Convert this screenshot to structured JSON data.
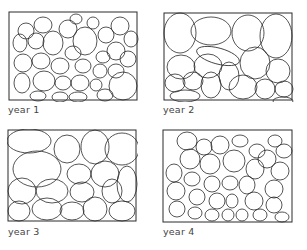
{
  "figure": {
    "panels": [
      {
        "label": "year 1",
        "density": "many small cells"
      },
      {
        "label": "year 2",
        "density": "fewer large cells"
      },
      {
        "label": "year 3",
        "density": "fewer large cells"
      },
      {
        "label": "year 4",
        "density": "many small cells"
      }
    ],
    "colors": {
      "stroke": "#2a2a2a",
      "background": "#ffffff",
      "label": "#444444"
    }
  }
}
